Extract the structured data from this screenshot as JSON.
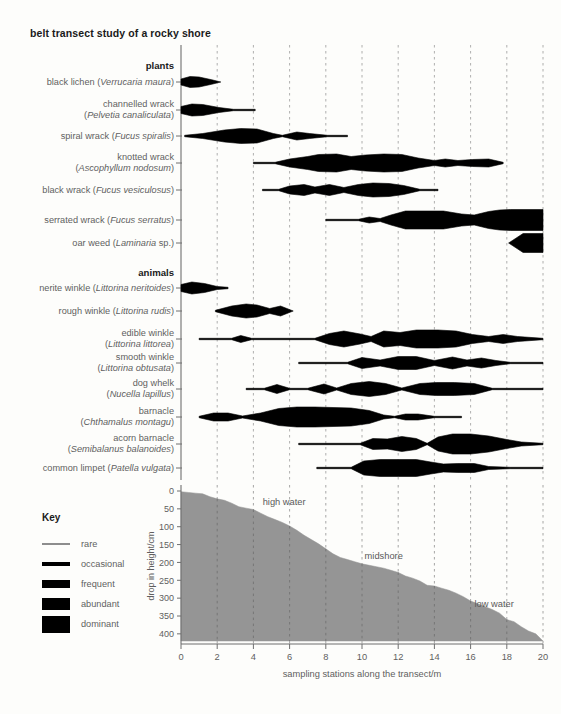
{
  "title": "belt transect study of a rocky shore",
  "axes": {
    "x_min": 0,
    "x_max": 20,
    "x_step": 2,
    "x_ticks": [
      "0",
      "2",
      "4",
      "6",
      "8",
      "10",
      "12",
      "14",
      "16",
      "18",
      "20"
    ],
    "x_title": "sampling stations along the transect/m",
    "y_ticks": [
      "0",
      "50",
      "100",
      "150",
      "200",
      "250",
      "300",
      "350",
      "400"
    ],
    "y_title": "drop in height/cm",
    "y_min": 0,
    "y_max": 420,
    "gridline_color": "#9a9a9a",
    "axis_color": "#6f6f6f"
  },
  "groups": [
    {
      "name": "plants",
      "label": "plants"
    },
    {
      "name": "animals",
      "label": "animals"
    }
  ],
  "key": {
    "title": "Key",
    "items": [
      {
        "label": "rare",
        "thickness": 1.4
      },
      {
        "label": "occasional",
        "thickness": 4.5
      },
      {
        "label": "frequent",
        "thickness": 8
      },
      {
        "label": "abundant",
        "thickness": 12
      },
      {
        "label": "dominant",
        "thickness": 17
      }
    ]
  },
  "abundance_scale": {
    "rare": 1.4,
    "occasional": 4.5,
    "frequent": 8,
    "abundant": 12,
    "dominant": 17
  },
  "species": [
    {
      "group": "plants",
      "common": "black lichen",
      "latin": "Verrucaria maura",
      "label_lines": [
        [
          "black lichen (",
          "Verrucaria maura",
          ")"
        ]
      ],
      "row_y": 82,
      "x": [
        0,
        0.5,
        1,
        1.7,
        2.2
      ],
      "w": [
        6,
        11,
        10,
        4.5,
        0
      ]
    },
    {
      "group": "plants",
      "common": "channelled wrack",
      "latin": "Pelvetia canaliculata",
      "label_lines": [
        [
          "channelled wrack"
        ],
        [
          "(",
          "Pelvetia canaliculata",
          ")"
        ]
      ],
      "row_y": 110,
      "x": [
        0,
        0.6,
        1.2,
        2.1,
        2.9,
        4.1
      ],
      "w": [
        7,
        12,
        11,
        5,
        1.4,
        1.4
      ]
    },
    {
      "group": "plants",
      "common": "spiral wrack",
      "latin": "Fucus spiralis",
      "label_lines": [
        [
          "spiral wrack (",
          "Fucus spiralis",
          ")"
        ]
      ],
      "row_y": 136,
      "x": [
        0.2,
        1.2,
        2.4,
        3.3,
        4.2,
        5.1,
        5.6,
        6.4,
        7.1,
        8.1,
        9.2
      ],
      "w": [
        1.4,
        5,
        12,
        15,
        14,
        5,
        1.4,
        8,
        5,
        1.4,
        1.4
      ]
    },
    {
      "group": "plants",
      "common": "knotted wrack",
      "latin": "Ascophyllum nodosum",
      "label_lines": [
        [
          "knotted wrack"
        ],
        [
          "(",
          "Ascophyllum nodosum",
          ")"
        ]
      ],
      "row_y": 163,
      "x": [
        4.0,
        5.2,
        6.0,
        7.0,
        7.6,
        8.6,
        9.4,
        10.2,
        11.2,
        12.2,
        13.1,
        14.0,
        14.6,
        15.3,
        16.1,
        17.0,
        17.8
      ],
      "w": [
        1.4,
        1.4,
        8,
        13,
        17,
        18,
        13,
        16,
        18,
        17,
        10,
        5,
        8,
        5,
        7,
        8,
        1.4
      ]
    },
    {
      "group": "plants",
      "common": "black wrack",
      "latin": "Fucus vesiculosus",
      "label_lines": [
        [
          "black wrack (",
          "Fucus vesiculosus",
          ")"
        ]
      ],
      "row_y": 190,
      "x": [
        4.5,
        5.4,
        6.0,
        6.8,
        7.4,
        8.2,
        9.0,
        9.8,
        10.6,
        11.5,
        12.3,
        13.2,
        14.2
      ],
      "w": [
        1.4,
        1.4,
        8,
        11,
        6,
        11,
        5,
        11,
        14,
        13,
        9,
        1.4,
        1.4
      ]
    },
    {
      "group": "plants",
      "common": "serrated wrack",
      "latin": "Fucus serratus",
      "label_lines": [
        [
          "serrated wrack (",
          "Fucus serratus",
          ")"
        ]
      ],
      "row_y": 220,
      "x": [
        8.0,
        9.8,
        10.4,
        11.0,
        11.6,
        12.4,
        14.5,
        15.5,
        16.2,
        17.0,
        17.6,
        18.2,
        20.0
      ],
      "w": [
        1.4,
        1.4,
        6,
        3,
        10,
        18,
        18,
        12,
        10,
        17,
        20,
        21,
        21
      ]
    },
    {
      "group": "plants",
      "common": "oar weed",
      "latin": "Laminaria sp.",
      "label_lines": [
        [
          "oar weed (",
          "Laminaria",
          " sp.)"
        ]
      ],
      "row_y": 243,
      "x": [
        18.1,
        18.9,
        20.0
      ],
      "w": [
        0,
        19,
        19
      ]
    },
    {
      "group": "animals",
      "common": "nerite winkle",
      "latin": "Littorina neritoides",
      "label_lines": [
        [
          "nerite winkle (",
          "Littorina neritoides",
          ")"
        ]
      ],
      "row_y": 288,
      "x": [
        0,
        0.6,
        1.3,
        2.0,
        2.6
      ],
      "w": [
        7,
        12,
        9,
        3,
        1.4
      ]
    },
    {
      "group": "animals",
      "common": "rough winkle",
      "latin": "Littorina rudis",
      "label_lines": [
        [
          "rough winkle (",
          "Littorina rudis",
          ")"
        ]
      ],
      "row_y": 311,
      "x": [
        1.9,
        2.8,
        3.6,
        4.2,
        4.9,
        5.5,
        6.2
      ],
      "w": [
        1.4,
        10,
        14,
        12,
        5,
        10,
        0
      ]
    },
    {
      "group": "animals",
      "common": "edible winkle",
      "latin": "Littorina littorea",
      "label_lines": [
        [
          "edible winkle"
        ],
        [
          "(",
          "Littorina littorea",
          ")"
        ]
      ],
      "row_y": 339,
      "x": [
        1.0,
        2.8,
        3.3,
        3.9,
        7.4,
        8.2,
        9.0,
        9.9,
        10.5,
        11.2,
        12.1,
        13.0,
        14.2,
        15.2,
        16.1,
        17.0,
        17.8,
        18.6,
        20.0
      ],
      "w": [
        1.4,
        1.4,
        7,
        1.4,
        1.4,
        11,
        16,
        10,
        5,
        16,
        13,
        18,
        18,
        16,
        9,
        5,
        9,
        5,
        1.4
      ]
    },
    {
      "group": "animals",
      "common": "smooth winkle",
      "latin": "Littorina obtusata",
      "label_lines": [
        [
          "smooth winkle"
        ],
        [
          "(",
          "Littorina obtusata",
          ")"
        ]
      ],
      "row_y": 363,
      "x": [
        6.5,
        9.2,
        10.0,
        11.0,
        12.0,
        13.0,
        14.0,
        15.0,
        15.8,
        16.6,
        17.4,
        18.2,
        20.0
      ],
      "w": [
        1.4,
        1.4,
        11,
        6,
        13,
        13,
        5,
        12,
        6,
        10,
        5,
        1.4,
        1.4
      ]
    },
    {
      "group": "animals",
      "common": "dog whelk",
      "latin": "Nucella lapillus",
      "label_lines": [
        [
          "dog whelk"
        ],
        [
          "(",
          "Nucella lapillus",
          ")"
        ]
      ],
      "row_y": 389,
      "x": [
        3.6,
        4.6,
        5.3,
        6.0,
        7.0,
        7.9,
        8.6,
        9.4,
        10.4,
        11.3,
        12.2,
        13.2,
        14.1,
        15.1,
        16.2,
        17.2,
        20.0
      ],
      "w": [
        1.4,
        1.4,
        9,
        1.4,
        1.4,
        10,
        2,
        11,
        15,
        11,
        2,
        11,
        13,
        13,
        11,
        1.4,
        1.4
      ]
    },
    {
      "group": "animals",
      "common": "barnacle",
      "latin": "Chthamalus montagu",
      "label_lines": [
        [
          "barnacle"
        ],
        [
          "(",
          "Chthamalus montagu",
          ")"
        ]
      ],
      "row_y": 417,
      "x": [
        1.0,
        1.8,
        2.6,
        3.4,
        4.4,
        5.4,
        6.4,
        7.4,
        8.4,
        9.4,
        10.4,
        11.2,
        11.8,
        12.4,
        13.1,
        14.0,
        15.5
      ],
      "w": [
        1.4,
        8,
        8,
        2,
        8,
        17,
        20,
        20,
        19,
        18,
        13,
        4,
        1.4,
        6,
        6,
        1.4,
        1.4
      ]
    },
    {
      "group": "animals",
      "common": "acorn barnacle",
      "latin": "Semibalanus balanoides",
      "label_lines": [
        [
          "acorn barnacle"
        ],
        [
          "(",
          "Semibalanus balanoides",
          ")"
        ]
      ],
      "row_y": 444,
      "x": [
        6.5,
        9.9,
        10.6,
        11.4,
        12.2,
        13.0,
        13.6,
        14.2,
        15.0,
        16.0,
        17.0,
        18.0,
        18.8,
        20.0
      ],
      "w": [
        1.4,
        1.4,
        11,
        10,
        15,
        11,
        1.4,
        14,
        20,
        20,
        16,
        9,
        4,
        1.4
      ]
    },
    {
      "group": "animals",
      "common": "common limpet",
      "latin": "Patella vulgata",
      "label_lines": [
        [
          "common limpet (",
          "Patella vulgata",
          ")"
        ]
      ],
      "row_y": 468,
      "x": [
        7.5,
        9.4,
        10.1,
        11.0,
        12.0,
        13.0,
        13.8,
        14.5,
        15.3,
        16.2,
        17.0,
        18.2,
        20.0
      ],
      "w": [
        1.4,
        1.4,
        14,
        17,
        17,
        17,
        12,
        8,
        9,
        9,
        3,
        1.4,
        1.4
      ]
    }
  ],
  "chart_data": {
    "type": "area",
    "title": "belt transect study of a rocky shore",
    "xlabel": "sampling stations along the transect/m",
    "ylabel": "drop in height/cm",
    "xlim": [
      0,
      20
    ],
    "ylim": [
      0,
      420
    ],
    "y_inverted": true,
    "grid": true,
    "series": [
      {
        "name": "shore profile",
        "fill": "#959595",
        "x": [
          0,
          0.4,
          0.8,
          1.2,
          1.6,
          2.0,
          2.4,
          2.8,
          3.2,
          3.6,
          4.0,
          4.4,
          4.8,
          5.2,
          5.6,
          6.0,
          6.4,
          6.8,
          7.2,
          7.6,
          8.0,
          8.4,
          8.8,
          9.2,
          9.6,
          10.0,
          10.4,
          10.8,
          11.2,
          11.6,
          12.0,
          12.4,
          12.8,
          13.2,
          13.6,
          14.0,
          14.4,
          14.8,
          15.2,
          15.6,
          16.0,
          16.4,
          16.8,
          17.2,
          17.6,
          18.0,
          18.4,
          18.8,
          19.2,
          19.6,
          20.0
        ],
        "y": [
          2,
          4,
          6,
          8,
          16,
          22,
          26,
          34,
          44,
          48,
          52,
          62,
          72,
          80,
          88,
          98,
          110,
          124,
          136,
          148,
          162,
          176,
          186,
          192,
          198,
          204,
          208,
          212,
          216,
          222,
          228,
          238,
          244,
          252,
          264,
          266,
          272,
          278,
          286,
          296,
          308,
          316,
          324,
          332,
          342,
          360,
          366,
          380,
          392,
          400,
          420
        ]
      }
    ],
    "annotations": [
      {
        "text": "high water",
        "x": 5.7,
        "y": 40,
        "name": "high-water-label"
      },
      {
        "text": "midshore",
        "x": 11.2,
        "y": 190,
        "name": "midshore-label"
      },
      {
        "text": "low water",
        "x": 17.3,
        "y": 325,
        "name": "low-water-label"
      }
    ]
  }
}
